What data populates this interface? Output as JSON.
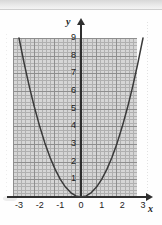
{
  "figure": {
    "y_axis_label": "y",
    "x_axis_label": "x"
  },
  "chart_data": {
    "type": "line",
    "title": "",
    "subtitle": "",
    "xlabel": "x",
    "ylabel": "y",
    "xlim": [
      -3.6,
      3.6
    ],
    "ylim": [
      0,
      9.6
    ],
    "grid": true,
    "grid_style": "graph-paper minor every 0.2 units, major every 1 unit",
    "legend": "none",
    "annotations": [],
    "xticks": [
      -3,
      -2,
      -1,
      0,
      1,
      2,
      3
    ],
    "xticklabels": [
      "-3",
      "-2",
      "-1",
      "0",
      "1",
      "2",
      "3"
    ],
    "yticks": [
      1,
      2,
      3,
      4,
      5,
      6,
      7,
      8,
      9
    ],
    "yticklabels": [
      "1",
      "2",
      "3",
      "4",
      "5",
      "6",
      "7",
      "8",
      "9"
    ],
    "series": [
      {
        "name": "y = x^2",
        "equation": "y = x^2",
        "vertex": [
          0,
          0
        ],
        "x": [
          -3,
          -2.75,
          -2.5,
          -2.25,
          -2,
          -1.75,
          -1.5,
          -1.25,
          -1,
          -0.75,
          -0.5,
          -0.25,
          0,
          0.25,
          0.5,
          0.75,
          1,
          1.25,
          1.5,
          1.75,
          2,
          2.25,
          2.5,
          2.75,
          3
        ],
        "values": [
          9,
          7.5625,
          6.25,
          5.0625,
          4,
          3.0625,
          2.25,
          1.5625,
          1,
          0.5625,
          0.25,
          0.0625,
          0,
          0.0625,
          0.25,
          0.5625,
          1,
          1.5625,
          2.25,
          3.0625,
          4,
          5.0625,
          6.25,
          7.5625,
          9
        ]
      }
    ]
  },
  "colors": {
    "curve": "#3a3a3a",
    "axis": "#2f2f2f",
    "grid_minor": "#b0b0b0",
    "grid_major": "#8e8e8e",
    "grid_background": "#d6d6d6",
    "label_text": "#1a1a1a"
  }
}
